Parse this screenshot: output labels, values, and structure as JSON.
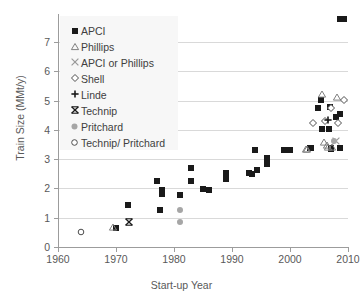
{
  "chart_data": {
    "type": "scatter",
    "title": "",
    "xlabel": "Start-up Year",
    "ylabel": "Train Size (MMt/y)",
    "xlim": [
      1960,
      2010
    ],
    "ylim": [
      0,
      7.7
    ],
    "xticks": [
      "1960",
      "1970",
      "1980",
      "1990",
      "2000",
      "2010"
    ],
    "yticks": [
      "0",
      "1",
      "2",
      "3",
      "4",
      "5",
      "6",
      "7"
    ],
    "grid": "horizontal",
    "legend_position": "upper-left-inside",
    "series": [
      {
        "name": "APCI",
        "marker": "filled-square",
        "color": "#1a1a1a",
        "points": [
          [
            1970.0,
            0.66
          ],
          [
            1972.0,
            1.45
          ],
          [
            1977.0,
            2.26
          ],
          [
            1977.6,
            1.27
          ],
          [
            1978.0,
            1.96
          ],
          [
            1978.0,
            1.8
          ],
          [
            1981.0,
            1.77
          ],
          [
            1983.0,
            2.71
          ],
          [
            1983.0,
            2.26
          ],
          [
            1985.0,
            1.97
          ],
          [
            1986.0,
            1.93
          ],
          [
            1989.0,
            2.51
          ],
          [
            1989.0,
            2.32
          ],
          [
            1993.0,
            2.53
          ],
          [
            1993.4,
            2.5
          ],
          [
            1994.0,
            3.31
          ],
          [
            1994.3,
            2.62
          ],
          [
            1996.0,
            3.03
          ],
          [
            1996.0,
            2.84
          ],
          [
            1999.0,
            3.31
          ],
          [
            2000.0,
            3.31
          ],
          [
            2003.4,
            3.37
          ],
          [
            2003.6,
            3.37
          ],
          [
            2004.8,
            4.73
          ],
          [
            2005.3,
            5.03
          ],
          [
            2005.6,
            4.04
          ],
          [
            2006.8,
            4.04
          ],
          [
            2006.9,
            4.78
          ],
          [
            2007.0,
            3.36
          ],
          [
            2007.1,
            3.37
          ],
          [
            2007.9,
            4.44
          ],
          [
            2008.6,
            4.53
          ],
          [
            2008.7,
            3.39
          ],
          [
            2008.7,
            7.8
          ],
          [
            2009.3,
            7.8
          ]
        ]
      },
      {
        "name": "Phillips",
        "marker": "open-triangle",
        "color": "#808080",
        "points": [
          [
            1969.4,
            0.7
          ],
          [
            2002.7,
            3.33
          ],
          [
            2003.0,
            3.35
          ],
          [
            2005.5,
            5.21
          ],
          [
            2005.8,
            3.57
          ],
          [
            2006.4,
            3.47
          ],
          [
            2006.5,
            3.4
          ],
          [
            2007.3,
            3.42
          ],
          [
            2008.1,
            5.13
          ]
        ]
      },
      {
        "name": "APCI or Phillips",
        "marker": "x-cross",
        "color": "#999999",
        "points": [
          [
            2007.9,
            3.63
          ]
        ]
      },
      {
        "name": "Shell",
        "marker": "open-diamond",
        "color": "#4d4d4d",
        "points": [
          [
            2003.9,
            4.24
          ],
          [
            2006.0,
            4.31
          ],
          [
            2007.1,
            4.74
          ],
          [
            2008.2,
            4.22
          ],
          [
            2009.3,
            5.03
          ]
        ]
      },
      {
        "name": "Linde",
        "marker": "plus",
        "color": "#1a1a1a",
        "points": [
          [
            2006.6,
            4.33
          ]
        ]
      },
      {
        "name": "Technip",
        "marker": "bowtie-x",
        "color": "#1a1a1a",
        "points": [
          [
            1972.2,
            0.85
          ]
        ]
      },
      {
        "name": "Pritchard",
        "marker": "filled-gray-circle",
        "color": "#a6a6a6",
        "points": [
          [
            1981.0,
            1.27
          ],
          [
            1981.0,
            0.87
          ],
          [
            2007.6,
            3.62
          ]
        ]
      },
      {
        "name": "Technip/ Pritchard",
        "marker": "open-circle",
        "color": "#4d4d4d",
        "points": [
          [
            1964.0,
            0.52
          ]
        ]
      }
    ]
  },
  "legend": {
    "items": [
      {
        "label": "APCI",
        "symbol": "filled-square-icon"
      },
      {
        "label": "Phillips",
        "symbol": "open-triangle-icon"
      },
      {
        "label": "APCI or Phillips",
        "symbol": "x-cross-icon"
      },
      {
        "label": "Shell",
        "symbol": "open-diamond-icon"
      },
      {
        "label": "Linde",
        "symbol": "plus-icon"
      },
      {
        "label": "Technip",
        "symbol": "bowtie-icon"
      },
      {
        "label": "Pritchard",
        "symbol": "gray-circle-icon"
      },
      {
        "label": "Technip/ Pritchard",
        "symbol": "open-circle-icon"
      }
    ]
  }
}
